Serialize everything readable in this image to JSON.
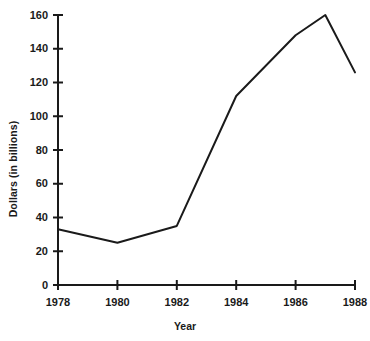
{
  "chart_data": {
    "type": "line",
    "title": "",
    "xlabel": "Year",
    "ylabel": "Dollars (in billions)",
    "x": [
      1978,
      1980,
      1982,
      1984,
      1986,
      1987,
      1988
    ],
    "values": [
      33,
      25,
      35,
      112,
      148,
      160,
      126
    ],
    "series": [
      {
        "name": "Dollars (in billions)",
        "values": [
          33,
          25,
          35,
          112,
          148,
          160,
          126
        ]
      }
    ],
    "xlim": [
      1978,
      1988
    ],
    "ylim": [
      0,
      160
    ],
    "xticks": [
      1978,
      1980,
      1982,
      1984,
      1986,
      1988
    ],
    "xtick_labels": [
      "1978",
      "1980",
      "1982",
      "1984",
      "1986",
      "1988"
    ],
    "yticks": [
      0,
      20,
      40,
      60,
      80,
      100,
      120,
      140,
      160
    ],
    "ytick_labels": [
      "0",
      "20",
      "40",
      "60",
      "80",
      "100",
      "120",
      "140",
      "160"
    ],
    "grid": false,
    "legend": false,
    "line_color": "#1a1a1a",
    "axis_color": "#1a1a1a"
  }
}
